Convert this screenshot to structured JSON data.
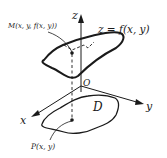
{
  "diagram": {
    "colors": {
      "stroke": "#1a1a1a",
      "background": "#ffffff"
    },
    "labels": {
      "z_axis": "z",
      "x_axis": "x",
      "y_axis": "y",
      "origin": "O",
      "surface_eq": "z = f(x, y)",
      "point_M": "M(x, y, f(x, y))",
      "region_D": "D",
      "point_P": "P(x, y)"
    }
  }
}
